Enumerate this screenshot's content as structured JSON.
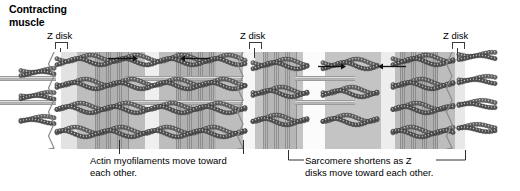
{
  "title": "Contracting\nmuscle",
  "labels": {
    "z_disk": "Z disk"
  },
  "z_disks": [
    {
      "name": "z-disk-label-left",
      "x": 47,
      "y": 30,
      "pointer_x": 55,
      "stem_top": 42,
      "stem_bottom": 52
    },
    {
      "name": "z-disk-label-middle",
      "x": 240,
      "y": 30,
      "pointer_x": 249,
      "stem_top": 42,
      "stem_bottom": 58
    },
    {
      "name": "z-disk-label-right",
      "x": 443,
      "y": 30,
      "pointer_x": 452,
      "stem_top": 42,
      "stem_bottom": 58
    }
  ],
  "captions": [
    {
      "name": "caption-actin",
      "text": "Actin myofilaments move toward\neach other.",
      "x": 90,
      "y": 155
    },
    {
      "name": "caption-sarcomere",
      "text": "Sarcomere shortens as Z\ndisks move toward each other.",
      "x": 305,
      "y": 155
    }
  ],
  "fibril": {
    "top": 52,
    "height": 97,
    "bands": [
      {
        "name": "i-band-left-1",
        "x": 61,
        "w": 16,
        "color": "#e2e2e2",
        "hatch": false
      },
      {
        "name": "a-band-left-1",
        "x": 77,
        "w": 68,
        "color": "#bdbdbd",
        "hatch": false
      },
      {
        "name": "overlap-left-1",
        "x": 95,
        "w": 34,
        "color": "#b0b0b0",
        "hatch": true
      },
      {
        "name": "i-band-left-2",
        "x": 145,
        "w": 14,
        "color": "#efefef",
        "hatch": false
      },
      {
        "name": "a-band-left-2",
        "x": 159,
        "w": 84,
        "color": "#bdbdbd",
        "hatch": false
      },
      {
        "name": "overlap-left-2",
        "x": 176,
        "w": 40,
        "color": "#b0b0b0",
        "hatch": true
      },
      {
        "name": "i-band-mid",
        "x": 243,
        "w": 12,
        "color": "#f6f6f6",
        "hatch": false
      },
      {
        "name": "a-band-right-1",
        "x": 255,
        "w": 48,
        "color": "#c4c4c4",
        "hatch": false
      },
      {
        "name": "overlap-right-1",
        "x": 263,
        "w": 34,
        "color": "#b6b6b6",
        "hatch": true
      },
      {
        "name": "h-zone-right",
        "x": 303,
        "w": 22,
        "color": "#fbfbfb",
        "hatch": false
      },
      {
        "name": "a-band-right-2",
        "x": 325,
        "w": 56,
        "color": "#c4c4c4",
        "hatch": false
      },
      {
        "name": "i-band-right-1",
        "x": 381,
        "w": 14,
        "color": "#ededed",
        "hatch": false
      },
      {
        "name": "a-band-right-3",
        "x": 395,
        "w": 60,
        "color": "#bdbdbd",
        "hatch": false
      },
      {
        "name": "overlap-right-2",
        "x": 400,
        "w": 38,
        "color": "#b0b0b0",
        "hatch": true
      },
      {
        "name": "i-band-right-2",
        "x": 455,
        "w": 10,
        "color": "#e8e8e8",
        "hatch": false
      }
    ],
    "z_lines": [
      {
        "name": "z-line-left",
        "x": 54
      },
      {
        "name": "z-line-middle",
        "x": 243
      },
      {
        "name": "z-line-right",
        "x": 452
      }
    ],
    "rods": [
      {
        "name": "myosin-rod-1",
        "x": 125,
        "y": 24,
        "w": 118
      },
      {
        "name": "myosin-rod-2",
        "x": 125,
        "y": 48,
        "w": 118
      },
      {
        "name": "myosin-rod-3",
        "x": 0,
        "y": 24,
        "w": 56
      },
      {
        "name": "myosin-rod-4",
        "x": 0,
        "y": 48,
        "w": 56
      },
      {
        "name": "myosin-rod-5",
        "x": 295,
        "y": 24,
        "w": 60
      },
      {
        "name": "myosin-rod-6",
        "x": 295,
        "y": 48,
        "w": 60
      }
    ],
    "actin_rows": [
      8,
      32,
      56,
      80
    ],
    "actin_strands": [
      {
        "name": "actin-stub-left",
        "x": 20,
        "rows": [
          20,
          44,
          68
        ],
        "w": 36,
        "wave": 1
      },
      {
        "name": "actin-left-upper",
        "x": 56,
        "rows": [
          8,
          32,
          56,
          80
        ],
        "w": 92,
        "wave": 2
      },
      {
        "name": "actin-left-lower",
        "x": 148,
        "rows": [
          8,
          32,
          56,
          80
        ],
        "w": 98,
        "wave": 2
      },
      {
        "name": "actin-right-upper",
        "x": 252,
        "rows": [
          12,
          40,
          68
        ],
        "w": 56,
        "wave": 2
      },
      {
        "name": "actin-right-lower",
        "x": 322,
        "rows": [
          12,
          40,
          68
        ],
        "w": 56,
        "wave": 2
      },
      {
        "name": "actin-right-inner",
        "x": 392,
        "rows": [
          8,
          32,
          56,
          80
        ],
        "w": 62,
        "wave": 2
      },
      {
        "name": "actin-stub-right",
        "x": 458,
        "rows": [
          4,
          28,
          52,
          76
        ],
        "w": 38,
        "wave": 1
      }
    ]
  },
  "arrows": [
    {
      "name": "arrow-right-sarcomere-1",
      "x": 108,
      "y": 54,
      "w": 30,
      "dir": "right"
    },
    {
      "name": "arrow-left-sarcomere-1",
      "x": 180,
      "y": 54,
      "w": 30,
      "dir": "left"
    },
    {
      "name": "arrow-right-sarcomere-2",
      "x": 318,
      "y": 62,
      "w": 28,
      "dir": "right"
    },
    {
      "name": "arrow-left-sarcomere-2",
      "x": 378,
      "y": 62,
      "w": 28,
      "dir": "left"
    }
  ],
  "leaders": [
    {
      "name": "leader-line-actin-left",
      "x": 119,
      "y": 140,
      "h": 14
    },
    {
      "name": "leader-line-actin-right",
      "x": 243,
      "y": 140,
      "h": 14
    }
  ],
  "bracket": {
    "name": "sarcomere-bracket",
    "x": 288,
    "y": 148,
    "w": 178,
    "label_gap_start": 16,
    "label_gap_end": 148
  },
  "colors": {
    "ink": "#000000",
    "line": "#2e2e2e",
    "actin_dark": "#4a4a4a",
    "actin_light": "#d8d8d8",
    "z_line": "#8a8a8a"
  }
}
